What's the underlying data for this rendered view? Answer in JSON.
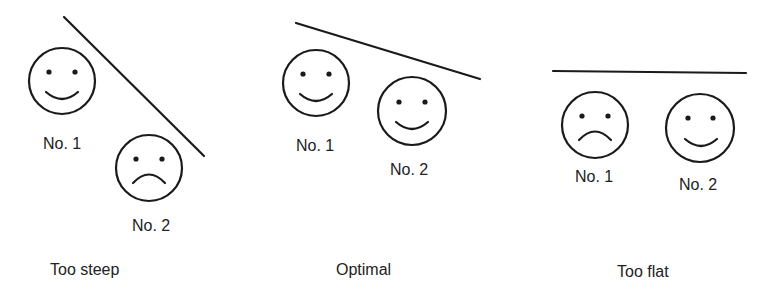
{
  "panels": [
    {
      "caption": "Too steep",
      "faces": [
        {
          "label": "No. 1",
          "mood": "happy"
        },
        {
          "label": "No. 2",
          "mood": "sad"
        }
      ]
    },
    {
      "caption": "Optimal",
      "faces": [
        {
          "label": "No. 1",
          "mood": "happy"
        },
        {
          "label": "No. 2",
          "mood": "happy"
        }
      ]
    },
    {
      "caption": "Too flat",
      "faces": [
        {
          "label": "No. 1",
          "mood": "sad"
        },
        {
          "label": "No. 2",
          "mood": "happy"
        }
      ]
    }
  ],
  "colors": {
    "stroke": "#1a1a1a",
    "background": "#ffffff"
  }
}
